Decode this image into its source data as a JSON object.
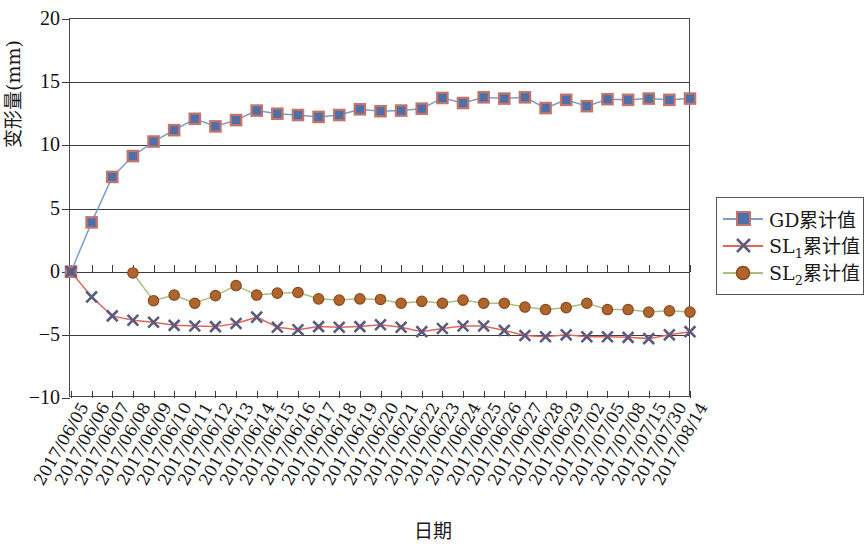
{
  "chart_data": {
    "type": "line",
    "title": "",
    "xlabel": "日期",
    "ylabel": "变形量(mm)",
    "ylim": [
      -10,
      20
    ],
    "yticks": [
      20,
      15,
      10,
      5,
      0,
      -5,
      -10
    ],
    "grid": true,
    "legend_position": "right",
    "categories": [
      "2017/06/05",
      "2017/06/06",
      "2017/06/07",
      "2017/06/08",
      "2017/06/09",
      "2017/06/10",
      "2017/06/11",
      "2017/06/12",
      "2017/06/13",
      "2017/06/14",
      "2017/06/15",
      "2017/06/16",
      "2017/06/17",
      "2017/06/18",
      "2017/06/19",
      "2017/06/20",
      "2017/06/21",
      "2017/06/22",
      "2017/06/23",
      "2017/06/24",
      "2017/06/25",
      "2017/06/26",
      "2017/06/27",
      "2017/06/28",
      "2017/06/29",
      "2017/07/02",
      "2017/07/05",
      "2017/07/08",
      "2017/07/15",
      "2017/07/30",
      "2017/08/14"
    ],
    "series": [
      {
        "name": "GD累计值",
        "marker": "square",
        "line_color": "#7e9ec6",
        "marker_fill": "#4f6fa8",
        "marker_edge": "#c4756a",
        "values": [
          0,
          3.9,
          7.5,
          9.15,
          10.3,
          11.2,
          12.1,
          11.5,
          12.0,
          12.75,
          12.5,
          12.4,
          12.25,
          12.4,
          12.85,
          12.7,
          12.75,
          12.9,
          13.75,
          13.35,
          13.8,
          13.7,
          13.8,
          12.95,
          13.6,
          13.1,
          13.65,
          13.6,
          13.7,
          13.6,
          13.7
        ]
      },
      {
        "name": "SL₁累计值",
        "marker": "cross",
        "line_color": "#e2675a",
        "marker_fill": "#5b5b80",
        "marker_edge": "#5b5b80",
        "values": [
          0,
          -2.0,
          -3.5,
          -3.85,
          -4.0,
          -4.25,
          -4.3,
          -4.35,
          -4.1,
          -3.6,
          -4.4,
          -4.6,
          -4.35,
          -4.4,
          -4.35,
          -4.2,
          -4.4,
          -4.75,
          -4.5,
          -4.3,
          -4.3,
          -4.65,
          -5.05,
          -5.15,
          -5.0,
          -5.15,
          -5.15,
          -5.2,
          -5.3,
          -5.0,
          -4.75
        ]
      },
      {
        "name": "SL₂累计值",
        "marker": "circle",
        "line_color": "#a8c07e",
        "marker_fill": "#b0652c",
        "marker_edge": "#8b4a1e",
        "values": [
          null,
          null,
          null,
          -0.1,
          -2.3,
          -1.85,
          -2.5,
          -1.9,
          -1.1,
          -1.85,
          -1.7,
          -1.65,
          -2.15,
          -2.25,
          -2.15,
          -2.2,
          -2.5,
          -2.35,
          -2.5,
          -2.25,
          -2.5,
          -2.5,
          -2.8,
          -3.0,
          -2.85,
          -2.5,
          -3.0,
          -3.0,
          -3.2,
          -3.1,
          -3.2
        ]
      }
    ]
  },
  "legend": {
    "items": [
      {
        "label_main": "GD",
        "label_sub": "",
        "label_rest": "累计值"
      },
      {
        "label_main": "SL",
        "label_sub": "1",
        "label_rest": "累计值"
      },
      {
        "label_main": "SL",
        "label_sub": "2",
        "label_rest": "累计值"
      }
    ]
  },
  "axis": {
    "y_title": "变形量(mm)",
    "x_title": "日期"
  }
}
